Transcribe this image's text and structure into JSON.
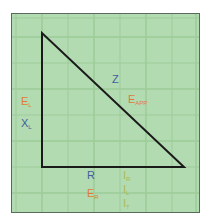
{
  "diagram": {
    "type": "impedance-triangle",
    "colors": {
      "background": "#b3dbb1",
      "grid": "#9ccb99",
      "triangle": "#1a1a1a",
      "blue_label": "#3f5f9f",
      "orange_label": "#e07a3a",
      "olive_label": "#a8b858"
    },
    "labels": {
      "z": {
        "main": "Z",
        "sub": ""
      },
      "e_app": {
        "main": "E",
        "sub": "APP"
      },
      "e_l": {
        "main": "E",
        "sub": "L"
      },
      "x_l": {
        "main": "X",
        "sub": "L"
      },
      "r": {
        "main": "R",
        "sub": ""
      },
      "e_r": {
        "main": "E",
        "sub": "R"
      },
      "i_r": {
        "main": "I",
        "sub": "R"
      },
      "i_l": {
        "main": "I",
        "sub": "L"
      },
      "i_t": {
        "main": "I",
        "sub": "T"
      }
    }
  }
}
